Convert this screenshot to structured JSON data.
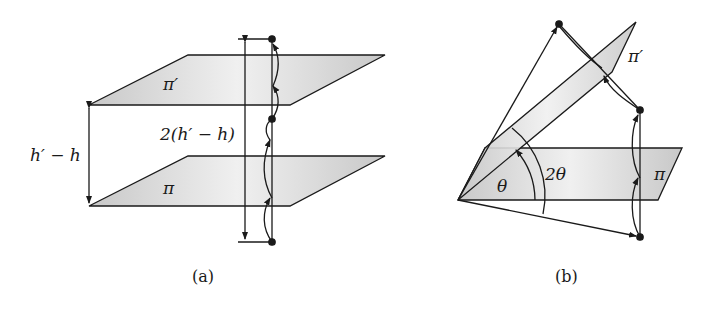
{
  "figure_a": {
    "caption": "(a)",
    "plane_upper_label": "π′",
    "plane_lower_label": "π",
    "gap_label": "h′ − h",
    "double_gap_label": "2(h′ − h)"
  },
  "figure_b": {
    "caption": "(b)",
    "plane_tilted_label": "π′",
    "plane_base_label": "π",
    "angle_small_label": "θ",
    "angle_large_label": "2θ"
  },
  "colors": {
    "plane_fill": "#d6d6d6",
    "stroke": "#1a1a1a",
    "background": "#ffffff"
  }
}
